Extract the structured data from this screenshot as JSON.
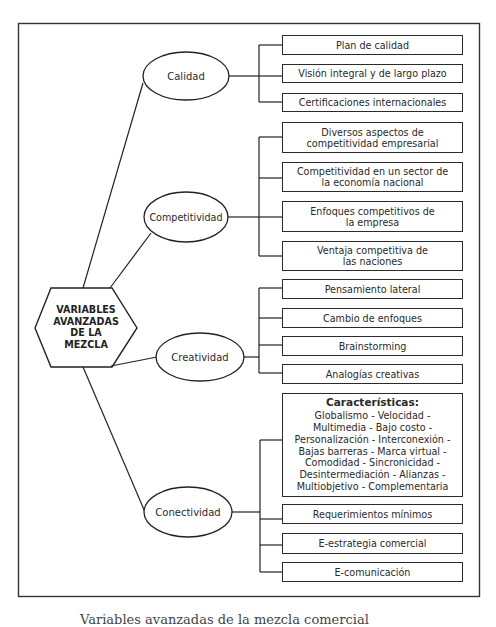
{
  "diagram": {
    "center": {
      "lines": [
        "VARIABLES",
        "AVANZADAS",
        "DE LA",
        "MEZCLA"
      ]
    },
    "branches": [
      {
        "label": "Calidad",
        "items": [
          {
            "lines": [
              "Plan de calidad"
            ]
          },
          {
            "lines": [
              "Visión integral y de largo plazo"
            ]
          },
          {
            "lines": [
              "Certificaciones internacionales"
            ]
          }
        ]
      },
      {
        "label": "Competitividad",
        "items": [
          {
            "lines": [
              "Diversos aspectos de",
              "competitividad empresarial"
            ]
          },
          {
            "lines": [
              "Competitividad en un sector de",
              "la economía nacional"
            ]
          },
          {
            "lines": [
              "Enfoques competitivos de",
              "la empresa"
            ]
          },
          {
            "lines": [
              "Ventaja competitiva de",
              "las naciones"
            ]
          }
        ]
      },
      {
        "label": "Creatividad",
        "items": [
          {
            "lines": [
              "Pensamiento lateral"
            ]
          },
          {
            "lines": [
              "Cambio de enfoques"
            ]
          },
          {
            "lines": [
              "Brainstorming"
            ]
          },
          {
            "lines": [
              "Analogías creativas"
            ]
          }
        ]
      },
      {
        "label": "Conectividad",
        "items": [
          {
            "heading": "Características:",
            "lines": [
              "Globalismo - Velocidad -",
              "Multimedia - Bajo costo -",
              "Personalización - Interconexión -",
              "Bajas barreras - Marca virtual -",
              "Comodidad - Sincronicidad -",
              "Desintermediación - Alianzas -",
              "Multiobjetivo - Complementaria"
            ]
          },
          {
            "lines": [
              "Requerimientos mínimos"
            ]
          },
          {
            "lines": [
              "E-estrategia comercial"
            ]
          },
          {
            "lines": [
              "E-comunicación"
            ]
          }
        ]
      }
    ]
  },
  "caption": "Variables avanzadas de la mezcla comercial"
}
